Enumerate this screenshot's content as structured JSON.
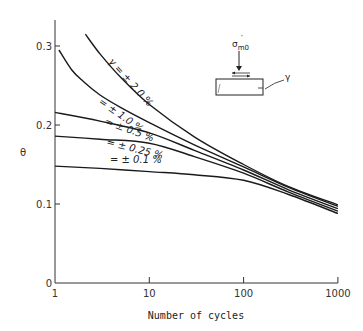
{
  "chart_data": {
    "type": "line",
    "title": "",
    "xlabel": "Number of cycles",
    "ylabel": "θ",
    "xscale": "log",
    "xlim": [
      1,
      1000
    ],
    "ylim": [
      0,
      0.35
    ],
    "grid": false,
    "x_ticks": [
      {
        "value": 1,
        "label": "1"
      },
      {
        "value": 10,
        "label": "10"
      },
      {
        "value": 100,
        "label": "100"
      },
      {
        "value": 1000,
        "label": "1000"
      }
    ],
    "y_ticks": [
      {
        "value": 0,
        "label": "0"
      },
      {
        "value": 0.1,
        "label": "0.1"
      },
      {
        "value": 0.2,
        "label": "0.2"
      },
      {
        "value": 0.3,
        "label": "0.3"
      }
    ],
    "series": [
      {
        "name": "γ = ± 2.0 %",
        "label": "γ = ± 2.0 %",
        "x": [
          2.1,
          3,
          5,
          10,
          30,
          100,
          300,
          1000
        ],
        "values": [
          0.315,
          0.29,
          0.26,
          0.226,
          0.185,
          0.15,
          0.122,
          0.099
        ],
        "label_pos": {
          "x": 108,
          "y": 62,
          "rot": 48
        }
      },
      {
        "name": "γ = ± 1.0 %",
        "label": "= ± 1.0 %",
        "x": [
          1.1,
          1.5,
          2,
          3,
          5,
          10,
          30,
          100,
          300,
          1000
        ],
        "values": [
          0.295,
          0.27,
          0.255,
          0.238,
          0.222,
          0.203,
          0.175,
          0.147,
          0.121,
          0.097
        ],
        "label_pos": {
          "x": 98,
          "y": 103,
          "rot": 35
        }
      },
      {
        "name": "γ = ± 0.5 %",
        "label": "= ± 0.5 %",
        "x": [
          1,
          3,
          10,
          30,
          100,
          300,
          1000
        ],
        "values": [
          0.216,
          0.205,
          0.19,
          0.168,
          0.143,
          0.118,
          0.094
        ],
        "label_pos": {
          "x": 104,
          "y": 124,
          "rot": 20
        }
      },
      {
        "name": "γ = ± 0.25 %",
        "label": "= ± 0.25 %",
        "x": [
          1,
          3,
          10,
          30,
          100,
          300,
          1000
        ],
        "values": [
          0.186,
          0.182,
          0.177,
          0.16,
          0.139,
          0.115,
          0.091
        ],
        "label_pos": {
          "x": 106,
          "y": 145,
          "rot": 14
        }
      },
      {
        "name": "γ = ± 0.1 %",
        "label": "= ± 0.1   %",
        "x": [
          1,
          3,
          10,
          30,
          100,
          300,
          1000
        ],
        "values": [
          0.148,
          0.145,
          0.141,
          0.137,
          0.13,
          0.112,
          0.088
        ],
        "label_pos": {
          "x": 110,
          "y": 163,
          "rot": 0
        }
      }
    ],
    "annotations": [
      {
        "text": "σ'm0",
        "desc": "effective mean confining stress arrow on specimen"
      },
      {
        "text": "γ",
        "desc": "shear strain indicator on specimen sketch"
      }
    ]
  },
  "inset": {
    "stress_label": "σ",
    "stress_sub": "m0",
    "stress_prime": "′",
    "strain_label": "γ"
  }
}
